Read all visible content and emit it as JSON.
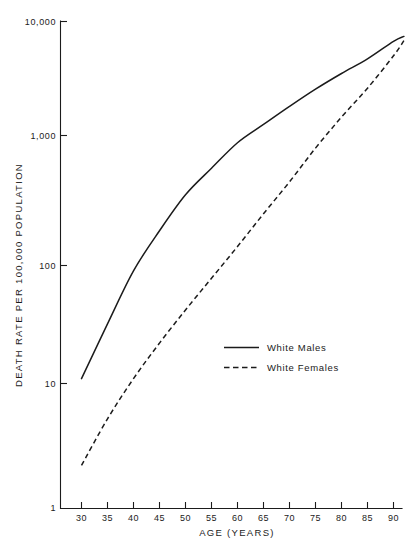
{
  "figure": {
    "background_color": "#ffffff",
    "ink_color": "#1b1b1b",
    "cropped_header_text": ""
  },
  "chart_data": {
    "type": "line",
    "title": "",
    "xlabel": "AGE (YEARS)",
    "ylabel": "DEATH RATE PER 100,000 POPULATION",
    "yscale": "log",
    "xscale": "linear",
    "xlim": [
      28,
      93
    ],
    "ylim": [
      1,
      10000
    ],
    "grid": false,
    "legend_position": "center-right",
    "x_tick_labels": [
      "30",
      "35",
      "40",
      "45",
      "50",
      "55",
      "60",
      "65",
      "70",
      "75",
      "80",
      "85",
      "90"
    ],
    "x_ticks": [
      30,
      35,
      40,
      45,
      50,
      55,
      60,
      65,
      70,
      75,
      80,
      85,
      90
    ],
    "y_tick_labels": [
      "1",
      "10",
      "100",
      "1,000",
      "10,000"
    ],
    "y_ticks": [
      1,
      10,
      100,
      1000,
      10000
    ],
    "x": [
      30,
      35,
      40,
      45,
      50,
      55,
      60,
      65,
      70,
      75,
      80,
      85,
      90,
      92
    ],
    "series": [
      {
        "name": "White Males",
        "style": "solid",
        "values": [
          11,
          32,
          90,
          185,
          350,
          560,
          880,
          1250,
          1800,
          2550,
          3500,
          4700,
          6700,
          7400
        ]
      },
      {
        "name": "White Females",
        "style": "dashed",
        "values": [
          2.2,
          5.2,
          11,
          22,
          42,
          78,
          140,
          250,
          440,
          800,
          1450,
          2600,
          5000,
          6800
        ]
      }
    ]
  },
  "legend": {
    "entries": [
      {
        "label": "White Males",
        "style": "solid"
      },
      {
        "label": "White Females",
        "style": "dashed"
      }
    ]
  },
  "axes": {
    "x_axis_title": "AGE (YEARS)",
    "y_axis_title": "DEATH RATE PER 100,000 POPULATION"
  }
}
